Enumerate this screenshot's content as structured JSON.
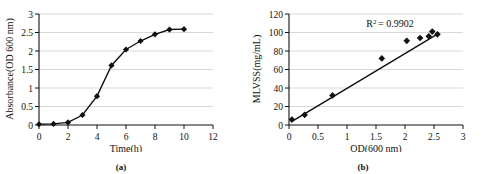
{
  "figure": {
    "panels": [
      {
        "caption": "(a)",
        "chart_data": {
          "type": "line",
          "title": "",
          "xlabel": "Time(h)",
          "ylabel": "Absorbance(OD 600 nm)",
          "xlim": [
            0,
            12
          ],
          "ylim": [
            0,
            3
          ],
          "xticks": [
            "0",
            "2",
            "4",
            "6",
            "8",
            "10",
            "12"
          ],
          "xtick_values": [
            0,
            2,
            4,
            6,
            8,
            10,
            12
          ],
          "yticks": [
            "0",
            "0.5",
            "1",
            "1.5",
            "2",
            "2.5",
            "3"
          ],
          "ytick_values": [
            0,
            0.5,
            1,
            1.5,
            2,
            2.5,
            3
          ],
          "grid": "horizontal",
          "legend": "none",
          "marker": "filled-diamond",
          "x": [
            0,
            1,
            2,
            3,
            4,
            5,
            6,
            7,
            8,
            9,
            10
          ],
          "values": [
            0.02,
            0.03,
            0.07,
            0.27,
            0.78,
            1.61,
            2.04,
            2.27,
            2.45,
            2.58,
            2.59
          ]
        }
      },
      {
        "caption": "(b)",
        "chart_data": {
          "type": "scatter",
          "title": "",
          "xlabel": "OD(600 nm)",
          "ylabel": "MLVSS(mg/mL)",
          "xlim": [
            0,
            3
          ],
          "ylim": [
            0,
            120
          ],
          "xticks": [
            "0",
            "0.5",
            "1",
            "1.5",
            "2",
            "2.5",
            "3"
          ],
          "xtick_values": [
            0,
            0.5,
            1,
            1.5,
            2,
            2.5,
            3
          ],
          "yticks": [
            "0",
            "20",
            "40",
            "60",
            "80",
            "100",
            "120"
          ],
          "ytick_values": [
            0,
            20,
            40,
            60,
            80,
            100,
            120
          ],
          "grid": "horizontal",
          "legend": "none",
          "marker": "filled-diamond",
          "annotation_r2_label": "R",
          "annotation_r2_sup": "2",
          "annotation_r2_value": "= 0.9902",
          "x": [
            0.05,
            0.27,
            0.75,
            1.6,
            2.03,
            2.26,
            2.41,
            2.47,
            2.56
          ],
          "values": [
            6,
            11,
            32,
            72,
            91,
            94,
            96,
            101,
            98
          ],
          "trendline": {
            "x": [
              0.03,
              2.58
            ],
            "y": [
              3,
              99
            ]
          }
        }
      }
    ]
  }
}
